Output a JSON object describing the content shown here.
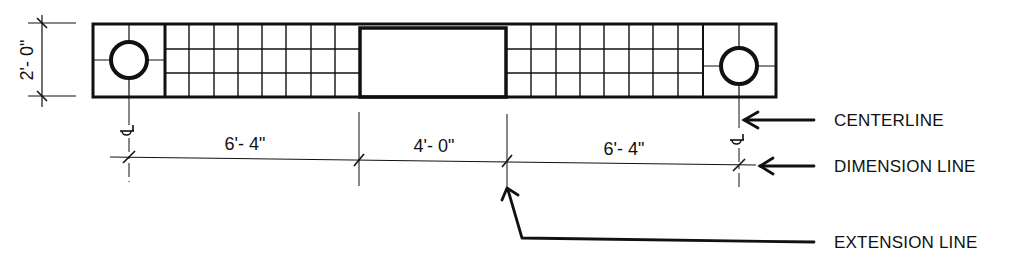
{
  "diagram": {
    "type": "plan-dimension-example",
    "colors": {
      "ink": "#111111",
      "background": "#ffffff"
    },
    "vertical_dimension": {
      "label": "2'- 0\""
    },
    "horizontal_dimensions": [
      {
        "label": "6'- 4\""
      },
      {
        "label": "4'- 0\""
      },
      {
        "label": "6'- 4\""
      }
    ],
    "callouts": {
      "centerline": "CENTERLINE",
      "dimension_line": "DIMENSION LINE",
      "extension_line": "EXTENSION LINE"
    },
    "symbols": {
      "centerline_symbol": "centerline-mark",
      "circle_fixture": "circle-icon"
    },
    "grid": {
      "left_panel_cols": 8,
      "right_panel_cols": 8,
      "rows": 3
    }
  }
}
